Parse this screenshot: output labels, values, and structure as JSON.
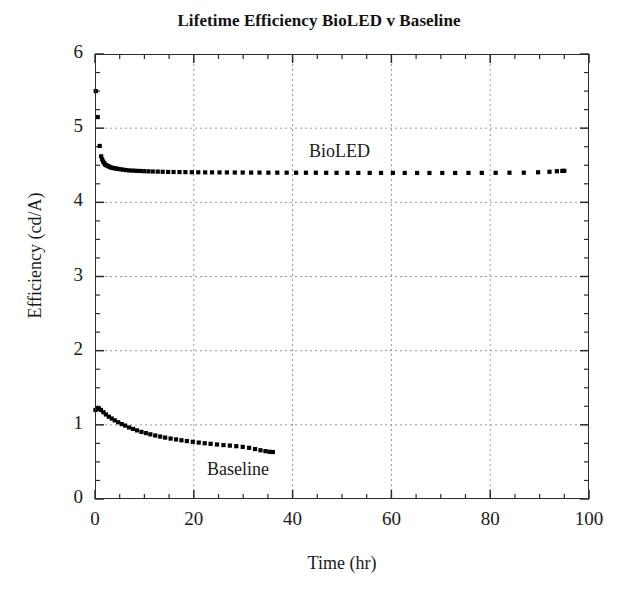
{
  "chart_data": {
    "type": "scatter",
    "title": "Lifetime Efficiency BioLED v Baseline",
    "xlabel": "Time (hr)",
    "ylabel": "Efficiency (cd/A)",
    "xlim": [
      0,
      100
    ],
    "ylim": [
      0,
      6
    ],
    "xticks": [
      0,
      20,
      40,
      60,
      80,
      100
    ],
    "yticks": [
      0,
      1,
      2,
      3,
      4,
      5,
      6
    ],
    "x_major_step": 20,
    "x_minor_step": 5,
    "y_major_step": 1,
    "y_minor_step": 0.25,
    "grid": true,
    "grid_style": "dotted",
    "grid_color": "#999999",
    "grid_x_values": [
      20,
      40,
      60,
      80
    ],
    "grid_y_values": [
      1,
      2,
      3,
      4,
      5
    ],
    "legend_position": "inline-annotations",
    "marker_color": "#000000",
    "marker_style": "filled-square",
    "series": [
      {
        "name": "BioLED",
        "label_x": 47,
        "label_y": 4.95,
        "points": [
          [
            0.15,
            5.5
          ],
          [
            0.55,
            5.15
          ],
          [
            0.95,
            4.76
          ],
          [
            1.25,
            4.62
          ],
          [
            1.45,
            4.58
          ],
          [
            1.65,
            4.55
          ],
          [
            1.85,
            4.53
          ],
          [
            2.05,
            4.51
          ],
          [
            2.3,
            4.5
          ],
          [
            2.6,
            4.49
          ],
          [
            2.9,
            4.48
          ],
          [
            3.2,
            4.47
          ],
          [
            3.5,
            4.465
          ],
          [
            3.9,
            4.46
          ],
          [
            4.3,
            4.455
          ],
          [
            4.7,
            4.45
          ],
          [
            5.2,
            4.445
          ],
          [
            5.7,
            4.44
          ],
          [
            6.3,
            4.435
          ],
          [
            6.9,
            4.43
          ],
          [
            7.6,
            4.428
          ],
          [
            8.3,
            4.425
          ],
          [
            9.1,
            4.423
          ],
          [
            9.9,
            4.42
          ],
          [
            10.8,
            4.418
          ],
          [
            11.7,
            4.416
          ],
          [
            12.7,
            4.414
          ],
          [
            13.7,
            4.412
          ],
          [
            14.8,
            4.41
          ],
          [
            15.9,
            4.409
          ],
          [
            17.1,
            4.408
          ],
          [
            18.3,
            4.407
          ],
          [
            19.6,
            4.406
          ],
          [
            20.9,
            4.405
          ],
          [
            22.3,
            4.404
          ],
          [
            23.7,
            4.404
          ],
          [
            25.2,
            4.403
          ],
          [
            26.7,
            4.403
          ],
          [
            28.3,
            4.402
          ],
          [
            29.9,
            4.402
          ],
          [
            31.6,
            4.401
          ],
          [
            33.3,
            4.401
          ],
          [
            35.1,
            4.4
          ],
          [
            36.9,
            4.4
          ],
          [
            38.8,
            4.4
          ],
          [
            40.7,
            4.399
          ],
          [
            42.7,
            4.399
          ],
          [
            44.7,
            4.399
          ],
          [
            46.8,
            4.398
          ],
          [
            48.9,
            4.398
          ],
          [
            51.1,
            4.398
          ],
          [
            53.3,
            4.397
          ],
          [
            55.6,
            4.397
          ],
          [
            57.9,
            4.397
          ],
          [
            60.3,
            4.397
          ],
          [
            62.7,
            4.396
          ],
          [
            65.2,
            4.396
          ],
          [
            67.7,
            4.396
          ],
          [
            70.3,
            4.396
          ],
          [
            72.9,
            4.396
          ],
          [
            75.6,
            4.397
          ],
          [
            78.3,
            4.397
          ],
          [
            81.1,
            4.398
          ],
          [
            83.9,
            4.399
          ],
          [
            86.8,
            4.4
          ],
          [
            89.7,
            4.405
          ],
          [
            92.0,
            4.412
          ],
          [
            93.5,
            4.42
          ],
          [
            94.6,
            4.424
          ],
          [
            95.0,
            4.425
          ]
        ]
      },
      {
        "name": "Baseline",
        "label_x": 23,
        "label_y": 0.37,
        "points": [
          [
            0.1,
            1.2
          ],
          [
            0.4,
            1.215
          ],
          [
            0.8,
            1.22
          ],
          [
            1.2,
            1.2
          ],
          [
            1.7,
            1.17
          ],
          [
            2.2,
            1.14
          ],
          [
            2.8,
            1.11
          ],
          [
            3.4,
            1.085
          ],
          [
            4.0,
            1.06
          ],
          [
            4.7,
            1.035
          ],
          [
            5.4,
            1.01
          ],
          [
            6.1,
            0.99
          ],
          [
            6.9,
            0.965
          ],
          [
            7.7,
            0.945
          ],
          [
            8.5,
            0.925
          ],
          [
            9.4,
            0.905
          ],
          [
            10.3,
            0.888
          ],
          [
            11.2,
            0.872
          ],
          [
            12.2,
            0.856
          ],
          [
            13.2,
            0.842
          ],
          [
            14.2,
            0.828
          ],
          [
            15.3,
            0.815
          ],
          [
            16.4,
            0.803
          ],
          [
            17.5,
            0.792
          ],
          [
            18.6,
            0.781
          ],
          [
            19.8,
            0.771
          ],
          [
            21.0,
            0.761
          ],
          [
            22.2,
            0.752
          ],
          [
            23.4,
            0.744
          ],
          [
            24.7,
            0.735
          ],
          [
            26.0,
            0.727
          ],
          [
            27.3,
            0.72
          ],
          [
            28.6,
            0.712
          ],
          [
            29.9,
            0.703
          ],
          [
            31.2,
            0.69
          ],
          [
            32.4,
            0.673
          ],
          [
            33.5,
            0.657
          ],
          [
            34.5,
            0.645
          ],
          [
            35.3,
            0.637
          ],
          [
            36.0,
            0.633
          ]
        ]
      }
    ]
  },
  "axis": {
    "y_labels": [
      "6",
      "5",
      "4",
      "3",
      "2",
      "1",
      "0"
    ],
    "x_labels": [
      "0",
      "20",
      "40",
      "60",
      "80",
      "100"
    ]
  }
}
